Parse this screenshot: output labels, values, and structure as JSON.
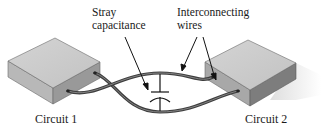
{
  "labels": {
    "stray_capacitance": {
      "line1": "Stray",
      "line2": "capacitance"
    },
    "interconnecting_wires": {
      "line1": "Interconnecting",
      "line2": "wires"
    },
    "circuit_1": "Circuit 1",
    "circuit_2": "Circuit 2"
  },
  "components": {
    "left_box": "Circuit 1 block",
    "right_box": "Circuit 2 block",
    "capacitor_symbol": "stray-capacitance-symbol",
    "wire_count": 2
  },
  "colors": {
    "background": "#ffffff",
    "box_top": "#c9c9c9",
    "box_side_light": "#b3b3b3",
    "box_side_dark": "#8c8c8c",
    "wire": "#555555",
    "wire_highlight": "#8a8a8a",
    "text": "#1a1a1a",
    "arrow": "#1a1a1a",
    "shadow": "#e6e6e6"
  }
}
